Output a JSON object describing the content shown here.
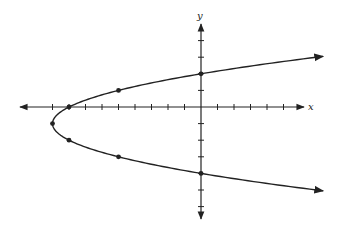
{
  "chart_data": {
    "type": "line",
    "title": "",
    "xlabel": "x",
    "ylabel": "y",
    "equation": "x = (y + 1)^2 - 9",
    "vertex": [
      -9,
      -1
    ],
    "opens": "right",
    "xlim": [
      -10,
      6
    ],
    "ylim": [
      -7,
      5
    ],
    "grid": false,
    "legend": null,
    "x_ticks": [
      -9,
      -8,
      -7,
      -6,
      -5,
      -4,
      -3,
      -2,
      -1,
      1,
      2,
      3,
      4,
      5
    ],
    "y_ticks": [
      -6,
      -5,
      -4,
      -3,
      -2,
      -1,
      1,
      2,
      3,
      4
    ],
    "tick_labels_shown": false,
    "series": [
      {
        "name": "parabola",
        "points": [
          {
            "x": 0,
            "y": 2
          },
          {
            "x": -5,
            "y": 1
          },
          {
            "x": -8,
            "y": 0
          },
          {
            "x": -9,
            "y": -1
          },
          {
            "x": -8,
            "y": -2
          },
          {
            "x": -5,
            "y": -3
          },
          {
            "x": 0,
            "y": -4
          }
        ],
        "color": "#222222",
        "arrows_at_ends": true
      }
    ]
  },
  "labels": {
    "x_axis": "x",
    "y_axis": "y"
  }
}
